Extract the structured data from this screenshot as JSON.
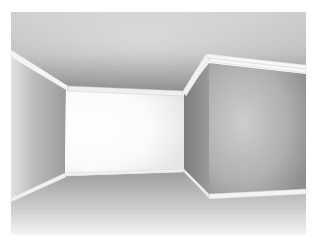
{
  "image": {
    "description": "3D rendered interior of an empty room with crown and baseboard moldings, a brightly lit back wall, and a protruding box-shaped wall section on the right",
    "frame": {
      "x": 11,
      "y": 12,
      "width": 295,
      "height": 223
    }
  },
  "colors": {
    "background": "#ffffff",
    "ceiling_light": "#e6e6e6",
    "ceiling_dark": "#9a9a9a",
    "back_wall": "#ffffff",
    "left_wall_light": "#d8d8d8",
    "left_wall_dark": "#a8a8a8",
    "pillar_side": "#8a8a8a",
    "pillar_front_light": "#c8c8c8",
    "pillar_front_dark": "#a0a0a0",
    "floor_light": "#f2f2f2",
    "floor_dark": "#a6a6a6",
    "molding": "#f4f4f4"
  }
}
